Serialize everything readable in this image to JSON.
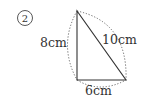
{
  "problem": {
    "number_label": "②"
  },
  "triangle": {
    "type": "right triangle",
    "vertical_side": "8cm",
    "hypotenuse": "10cm",
    "horizontal_side": "6cm"
  },
  "colors": {
    "stroke": "#333333",
    "dotted": "#555555",
    "background": "#ffffff"
  }
}
